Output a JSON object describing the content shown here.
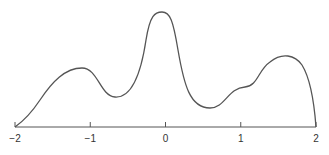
{
  "chart_data": {
    "type": "line",
    "title": "",
    "xlabel": "",
    "ylabel": "",
    "xlim": [
      -2,
      2
    ],
    "grid": false,
    "legend": null,
    "x_ticks": [
      "-2",
      "-1",
      "0",
      "1",
      "2"
    ],
    "series": [
      {
        "name": "density curve",
        "color": "#555555",
        "points": [
          [
            -2.0,
            0.0
          ],
          [
            -1.85,
            0.1
          ],
          [
            -1.6,
            0.33
          ],
          [
            -1.35,
            0.5
          ],
          [
            -1.15,
            0.51
          ],
          [
            -1.0,
            0.4
          ],
          [
            -0.8,
            0.26
          ],
          [
            -0.6,
            0.3
          ],
          [
            -0.4,
            0.55
          ],
          [
            -0.25,
            0.93
          ],
          [
            -0.12,
            1.0
          ],
          [
            0.0,
            0.96
          ],
          [
            0.15,
            0.6
          ],
          [
            0.3,
            0.28
          ],
          [
            0.55,
            0.17
          ],
          [
            0.75,
            0.23
          ],
          [
            0.95,
            0.35
          ],
          [
            1.15,
            0.38
          ],
          [
            1.35,
            0.52
          ],
          [
            1.6,
            0.62
          ],
          [
            1.8,
            0.55
          ],
          [
            1.92,
            0.35
          ],
          [
            2.0,
            0.0
          ]
        ]
      }
    ]
  },
  "axis": {
    "tick_labels": [
      "−2",
      "−1",
      "0",
      "1",
      "2"
    ]
  }
}
